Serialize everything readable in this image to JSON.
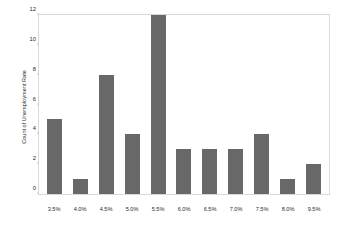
{
  "chart_data": {
    "type": "bar",
    "title": "",
    "title_note": "illegible faint light-gray text",
    "xlabel": "",
    "ylabel": "Count of Unemployment Rate",
    "categories": [
      "3.5%",
      "4.0%",
      "4.5%",
      "5.0%",
      "5.5%",
      "6.0%",
      "6.5%",
      "7.0%",
      "7.5%",
      "8.0%",
      "9.5%"
    ],
    "values": [
      5,
      1,
      8,
      4,
      12,
      3,
      3,
      3,
      4,
      1,
      2
    ],
    "ylim": [
      0,
      12
    ],
    "yticks": [
      0,
      2,
      4,
      6,
      8,
      10,
      12
    ],
    "ytick_labels": [
      "0",
      "2",
      "4",
      "6",
      "8",
      "10",
      "12"
    ],
    "grid": false,
    "legend": false,
    "bar_color": "#686868",
    "frame_color": "#d9d9d9",
    "background": "#ffffff",
    "text_color": "#2a2a2a"
  }
}
